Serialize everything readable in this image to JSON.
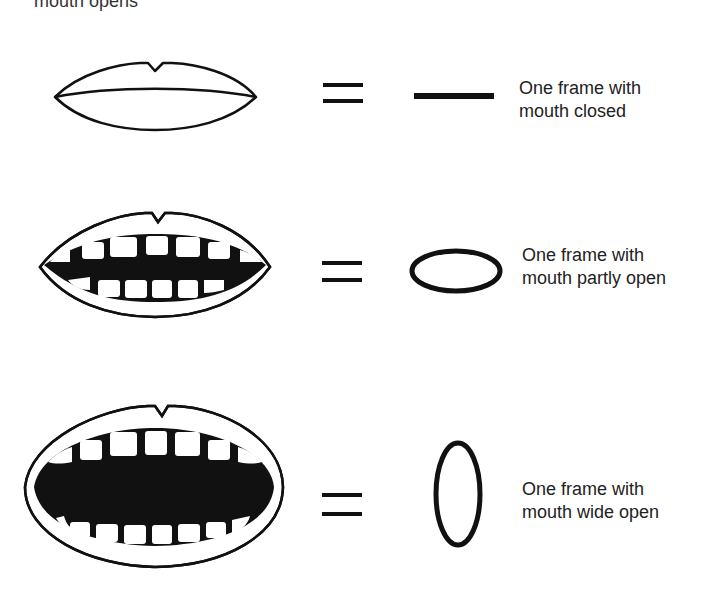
{
  "diagram": {
    "title_partial": "mouth opens",
    "rows": [
      {
        "mouth_state": "closed",
        "symbol": "horizontal-line",
        "equals": "=",
        "label_line1": "One frame with",
        "label_line2": "mouth closed"
      },
      {
        "mouth_state": "partly-open",
        "symbol": "horizontal-ellipse",
        "equals": "=",
        "label_line1": "One frame with",
        "label_line2": "mouth partly open"
      },
      {
        "mouth_state": "wide-open",
        "symbol": "vertical-ellipse",
        "equals": "=",
        "label_line1": "One frame with",
        "label_line2": "mouth wide open"
      }
    ],
    "colors": {
      "ink": "#111111",
      "background": "#ffffff"
    }
  }
}
